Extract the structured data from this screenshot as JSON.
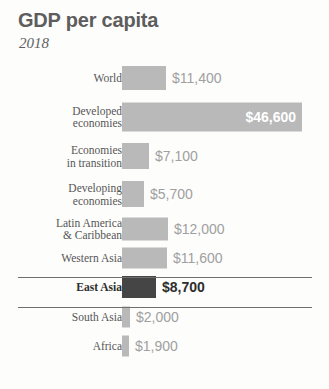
{
  "chart_data": {
    "type": "bar",
    "orientation": "horizontal",
    "title": "GDP per capita",
    "subtitle": "2018",
    "xlabel": "",
    "ylabel": "",
    "currency_prefix": "$",
    "xlim": [
      0,
      46600
    ],
    "grid": false,
    "legend": null,
    "highlight_category": "East Asia",
    "colors": {
      "bar": "#b9b9b9",
      "bar_highlight": "#454545",
      "value_label": "#a0a0a0",
      "value_label_inside": "#ffffff",
      "value_label_highlight": "#2e2e2e",
      "category_label": "#565656",
      "title": "#5d5d5d",
      "rule": "#6f6f6f",
      "background": "#fdfdfc"
    },
    "categories": [
      "World",
      "Developed economies",
      "Economies in transition",
      "Developing economies",
      "Latin America & Caribbean",
      "Western Asia",
      "East Asia",
      "South Asia",
      "Africa"
    ],
    "values": [
      11400,
      46600,
      7100,
      5700,
      12000,
      11600,
      8700,
      2000,
      1900
    ],
    "value_labels": [
      "$11,400",
      "$46,600",
      "$7,100",
      "$5,700",
      "$12,000",
      "$11,600",
      "$8,700",
      "$2,000",
      "$1,900"
    ]
  },
  "rows": [
    {
      "label": "World",
      "value": 11400,
      "value_label": "$11,400",
      "label_inside": false,
      "highlight": false,
      "bar_px": 44,
      "bar_h": 24,
      "row_h": 36
    },
    {
      "label": "Developed\neconomies",
      "value": 46600,
      "value_label": "$46,600",
      "label_inside": true,
      "highlight": false,
      "bar_px": 180,
      "bar_h": 29,
      "row_h": 41
    },
    {
      "label": "Economies\nin transition",
      "value": 7100,
      "value_label": "$7,100",
      "label_inside": false,
      "highlight": false,
      "bar_px": 27,
      "bar_h": 26,
      "row_h": 38
    },
    {
      "label": "Developing\neconomies",
      "value": 5700,
      "value_label": "$5,700",
      "label_inside": false,
      "highlight": false,
      "bar_px": 22,
      "bar_h": 26,
      "row_h": 38
    },
    {
      "label": "Latin America\n& Caribbean",
      "value": 12000,
      "value_label": "$12,000",
      "label_inside": false,
      "highlight": false,
      "bar_px": 46,
      "bar_h": 23,
      "row_h": 31
    },
    {
      "label": "Western Asia",
      "value": 11600,
      "value_label": "$11,600",
      "label_inside": false,
      "highlight": false,
      "bar_px": 45,
      "bar_h": 21,
      "row_h": 28
    },
    {
      "label": "East Asia",
      "value": 8700,
      "value_label": "$8,700",
      "label_inside": false,
      "highlight": true,
      "bar_px": 34,
      "bar_h": 22,
      "row_h": 30
    },
    {
      "label": "South Asia",
      "value": 2000,
      "value_label": "$2,000",
      "label_inside": false,
      "highlight": false,
      "bar_px": 8,
      "bar_h": 21,
      "row_h": 29
    },
    {
      "label": "Africa",
      "value": 1900,
      "value_label": "$1,900",
      "label_inside": false,
      "highlight": false,
      "bar_px": 7,
      "bar_h": 21,
      "row_h": 29
    }
  ]
}
